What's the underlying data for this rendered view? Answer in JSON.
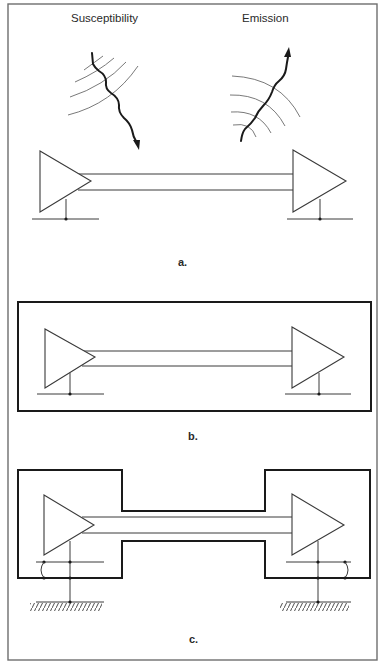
{
  "figure": {
    "panel_a": {
      "label": "a.",
      "captions": {
        "susceptibility": "Susceptibility",
        "emission": "Emission"
      },
      "elements": [
        "driver-amplifier",
        "receiver-amplifier",
        "signal-pair",
        "ground-reference-left",
        "ground-reference-right",
        "incoming-interference-wave",
        "outgoing-emission-wave"
      ]
    },
    "panel_b": {
      "label": "b.",
      "elements": [
        "full-enclosure-shield",
        "driver-amplifier",
        "receiver-amplifier",
        "signal-pair",
        "ground-reference-left",
        "ground-reference-right"
      ]
    },
    "panel_c": {
      "label": "c.",
      "elements": [
        "dumbbell-shield",
        "driver-amplifier",
        "receiver-amplifier",
        "signal-pair",
        "shield-bond-left",
        "shield-bond-right",
        "earth-ground-left",
        "earth-ground-right"
      ]
    },
    "colors": {
      "line": "#3a3a3a",
      "shield": "#1a1a1a",
      "arc": "#6a6a6a",
      "frame": "#6e6e6e",
      "background": "#ffffff"
    }
  }
}
